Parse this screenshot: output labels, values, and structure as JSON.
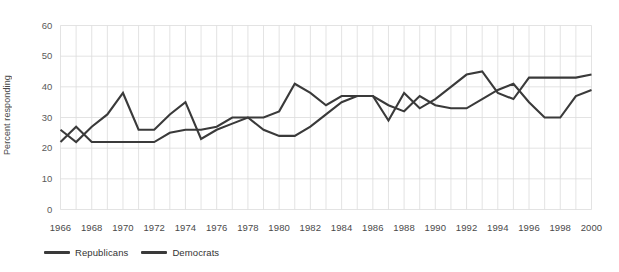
{
  "chart_data": {
    "type": "line",
    "title": "",
    "xlabel": "",
    "ylabel": "Percent responding",
    "ylim": [
      0,
      60
    ],
    "yticks": [
      0,
      10,
      20,
      30,
      40,
      50,
      60
    ],
    "xlim": [
      1966,
      2000
    ],
    "xticks": [
      1966,
      1968,
      1970,
      1972,
      1974,
      1976,
      1978,
      1980,
      1982,
      1984,
      1986,
      1988,
      1990,
      1992,
      1994,
      1996,
      1998,
      2000
    ],
    "grid": true,
    "legend_position": "bottom-left",
    "x": [
      1966,
      1967,
      1968,
      1969,
      1970,
      1971,
      1972,
      1973,
      1974,
      1975,
      1976,
      1977,
      1978,
      1979,
      1980,
      1981,
      1982,
      1983,
      1984,
      1985,
      1986,
      1987,
      1988,
      1989,
      1990,
      1991,
      1992,
      1993,
      1994,
      1995,
      1996,
      1997,
      1998,
      1999,
      2000
    ],
    "series": [
      {
        "name": "Republicans",
        "color": "#3a3a3a",
        "values": [
          26,
          22,
          27,
          31,
          38,
          26,
          26,
          31,
          35,
          23,
          26,
          28,
          30,
          30,
          32,
          41,
          38,
          34,
          37,
          37,
          37,
          29,
          38,
          33,
          36,
          40,
          44,
          45,
          38,
          36,
          43,
          43,
          43,
          43,
          44
        ]
      },
      {
        "name": "Democrats",
        "color": "#3a3a3a",
        "values": [
          22,
          27,
          22,
          22,
          22,
          22,
          22,
          25,
          26,
          26,
          27,
          30,
          30,
          26,
          24,
          24,
          27,
          31,
          35,
          37,
          37,
          34,
          32,
          37,
          34,
          33,
          33,
          36,
          39,
          41,
          35,
          30,
          30,
          37,
          39
        ]
      }
    ]
  }
}
